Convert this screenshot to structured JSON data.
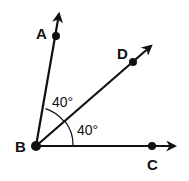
{
  "diagram": {
    "type": "geometry-angles",
    "colors": {
      "stroke": "#111111",
      "background": "#ffffff"
    },
    "vertex": {
      "name": "B",
      "label": "B"
    },
    "rays": [
      {
        "name": "BA",
        "point_label": "A"
      },
      {
        "name": "BD",
        "point_label": "D"
      },
      {
        "name": "BC",
        "point_label": "C"
      }
    ],
    "angles": [
      {
        "name": "angle-ABD",
        "label": "40°"
      },
      {
        "name": "angle-DBC",
        "label": "40°"
      }
    ],
    "labels": {
      "A": "A",
      "B": "B",
      "C": "C",
      "D": "D",
      "angle_ABD": "40°",
      "angle_DBC": "40°"
    }
  }
}
